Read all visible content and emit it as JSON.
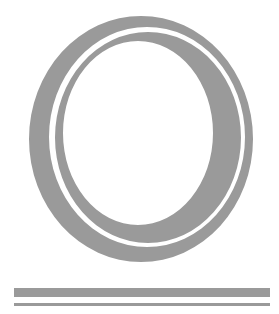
{
  "graphic": {
    "glyph": "O",
    "icon": "double-ring-letter-o",
    "color": "#9a9a9a",
    "background": "#ffffff"
  },
  "underline": {
    "bars": [
      "thick",
      "thin"
    ]
  }
}
